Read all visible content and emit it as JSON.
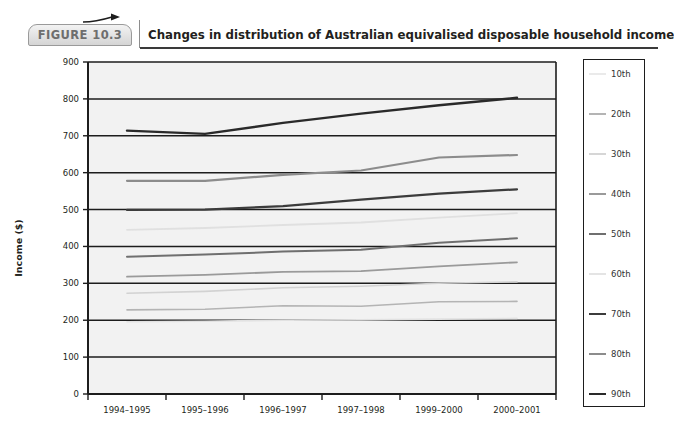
{
  "header": {
    "badge_label": "FIGURE 10.3",
    "title": "Changes in distribution of Australian equivalised disposable household income",
    "arrow_icon": "arrow-right-icon"
  },
  "chart_data": {
    "type": "line",
    "title": "Changes in distribution of Australian equivalised disposable household income",
    "xlabel": "",
    "ylabel": "Income ($)",
    "categories": [
      "1994–1995",
      "1995–1996",
      "1996–1997",
      "1997–1998",
      "1999–2000",
      "2000–2001"
    ],
    "ylim": [
      0,
      900
    ],
    "yticks": [
      0,
      100,
      200,
      300,
      400,
      500,
      600,
      700,
      800,
      900
    ],
    "ytick_labels": [
      "0",
      "100",
      "200",
      "300",
      "400",
      "500",
      "600",
      "700",
      "800",
      "900"
    ],
    "grid": true,
    "legend_position": "right",
    "series": [
      {
        "name": "10th",
        "color": "#e2e2e2",
        "width": 1.6,
        "values": [
          196,
          197,
          200,
          201,
          203,
          205
        ]
      },
      {
        "name": "20th",
        "color": "#b4b4b4",
        "width": 1.6,
        "values": [
          228,
          230,
          239,
          238,
          250,
          251
        ]
      },
      {
        "name": "30th",
        "color": "#d2d2d2",
        "width": 1.6,
        "values": [
          273,
          278,
          288,
          292,
          300,
          304
        ]
      },
      {
        "name": "40th",
        "color": "#9a9a9a",
        "width": 1.8,
        "values": [
          318,
          323,
          331,
          333,
          346,
          357
        ]
      },
      {
        "name": "50th",
        "color": "#6f6f6f",
        "width": 2.0,
        "values": [
          372,
          378,
          386,
          391,
          410,
          422
        ]
      },
      {
        "name": "60th",
        "color": "#e0e0e0",
        "width": 1.8,
        "values": [
          445,
          450,
          458,
          465,
          478,
          490
        ]
      },
      {
        "name": "70th",
        "color": "#3c3c3c",
        "width": 2.2,
        "values": [
          499,
          500,
          509,
          527,
          543,
          555
        ]
      },
      {
        "name": "80th",
        "color": "#8c8c8c",
        "width": 2.2,
        "values": [
          578,
          578,
          594,
          606,
          641,
          648
        ]
      },
      {
        "name": "90th",
        "color": "#2a2a2a",
        "width": 2.4,
        "values": [
          714,
          705,
          735,
          760,
          783,
          803
        ]
      }
    ]
  },
  "legend": {
    "entries": [
      {
        "label": "10th",
        "color": "#eaeaea"
      },
      {
        "label": "20th",
        "color": "#b4b4b4"
      },
      {
        "label": "30th",
        "color": "#d6d6d6"
      },
      {
        "label": "40th",
        "color": "#9a9a9a"
      },
      {
        "label": "50th",
        "color": "#6f6f6f"
      },
      {
        "label": "60th",
        "color": "#e4e4e4"
      },
      {
        "label": "70th",
        "color": "#3c3c3c"
      },
      {
        "label": "80th",
        "color": "#8c8c8c"
      },
      {
        "label": "90th",
        "color": "#2a2a2a"
      }
    ]
  }
}
